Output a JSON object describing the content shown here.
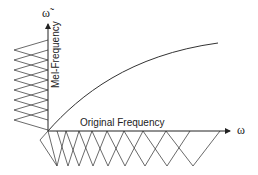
{
  "diagram": {
    "x_axis": {
      "label": "Original Frequency",
      "symbol": "ω"
    },
    "y_axis": {
      "label": "Mel-Frequency",
      "symbol": "ω̃"
    },
    "curve": {
      "description": "concave mapping from original frequency to mel frequency"
    },
    "mel_filters": {
      "count": 9,
      "shape": "uniform overlapping triangles on mel axis"
    },
    "linear_filters": {
      "count": 10,
      "shape": "overlapping triangles with increasing width on original frequency axis"
    },
    "colors": {
      "line": "#333333",
      "background": "#ffffff"
    }
  }
}
